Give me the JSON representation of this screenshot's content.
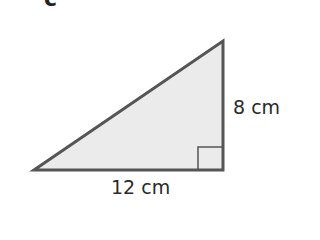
{
  "figure": {
    "part_label": "c",
    "shape": "right-triangle",
    "colors": {
      "fill": "#ebebeb",
      "stroke": "#555555",
      "text": "#2a2a2a"
    },
    "dimensions": {
      "height_label": "8 cm",
      "base_label": "12 cm"
    },
    "right_angle_marker": "bottom-right"
  }
}
